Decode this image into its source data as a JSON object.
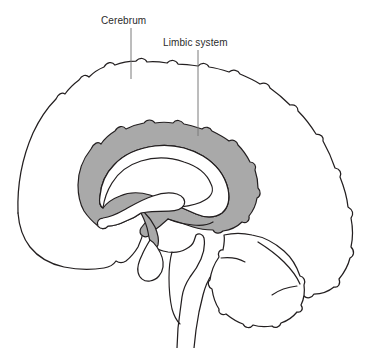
{
  "figure": {
    "kind": "anatomical-diagram",
    "background_color": "#ffffff",
    "outline_color": "#231f20",
    "shaded_region_color": "#a9a9a9",
    "label_text_color": "#2b2b2b",
    "leader_line_color": "#7a7a7a"
  },
  "labels": [
    {
      "id": "cerebrum",
      "text": "Cerebrum",
      "leader": {
        "x": 131,
        "y_top": 28,
        "y_bottom": 79,
        "orientation": "vertical",
        "points_to": "outer cerebral cortex surface"
      }
    },
    {
      "id": "limbic-system",
      "text": "Limbic system",
      "leader": {
        "x": 198,
        "y_top": 50,
        "y_bottom": 136,
        "orientation": "vertical",
        "points_to": "shaded limbic ring (cingulate gyrus)"
      }
    }
  ],
  "structures": [
    {
      "id": "cerebrum-outline",
      "name": "Cerebrum",
      "shaded": false
    },
    {
      "id": "limbic-ring",
      "name": "Limbic system",
      "shaded": true
    },
    {
      "id": "corpus-callosum",
      "name": "Corpus callosum",
      "shaded": false
    },
    {
      "id": "fornix",
      "name": "Fornix",
      "shaded": false
    },
    {
      "id": "thalamus",
      "name": "Thalamus",
      "shaded": false
    },
    {
      "id": "hypothalamus",
      "name": "Hypothalamus",
      "shaded": true
    },
    {
      "id": "pituitary-gland",
      "name": "Pituitary gland",
      "shaded": false
    },
    {
      "id": "brainstem",
      "name": "Brainstem",
      "shaded": false
    },
    {
      "id": "cerebellum",
      "name": "Cerebellum",
      "shaded": false
    }
  ]
}
